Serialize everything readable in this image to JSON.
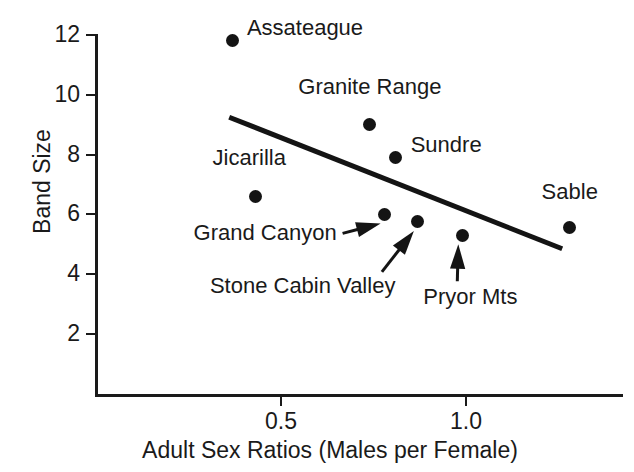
{
  "chart_data": {
    "type": "scatter",
    "title": "",
    "xlabel": "Adult Sex Ratios (Males per Female)",
    "ylabel": "Band Size",
    "xlim": [
      0.0,
      1.43
    ],
    "ylim": [
      1.0,
      12.4
    ],
    "xticks": [
      "0.5",
      "1.0"
    ],
    "xtick_values": [
      0.5,
      1.0
    ],
    "yticks": [
      "2",
      "4",
      "6",
      "8",
      "10",
      "12"
    ],
    "ytick_values": [
      2,
      4,
      6,
      8,
      10,
      12
    ],
    "grid": false,
    "legend": null,
    "points": [
      {
        "label": "Assateague",
        "x": 0.37,
        "y": 11.8,
        "label_side": "right",
        "leader": "none"
      },
      {
        "label": "Granite Range",
        "x": 0.74,
        "y": 9.0,
        "label_side": "above",
        "leader": "none"
      },
      {
        "label": "Sundre",
        "x": 0.81,
        "y": 7.9,
        "label_side": "right",
        "leader": "none"
      },
      {
        "label": "Jicarilla",
        "x": 0.43,
        "y": 6.6,
        "label_side": "above",
        "leader": "none"
      },
      {
        "label": "Grand Canyon",
        "x": 0.78,
        "y": 6.0,
        "label_side": "left",
        "leader": "arrow"
      },
      {
        "label": "Stone Cabin Valley",
        "x": 0.87,
        "y": 5.75,
        "label_side": "below",
        "leader": "arrow"
      },
      {
        "label": "Pryor Mts",
        "x": 0.99,
        "y": 5.3,
        "label_side": "below",
        "leader": "arrow"
      },
      {
        "label": "Sable",
        "x": 1.28,
        "y": 5.55,
        "label_side": "above",
        "leader": "none"
      }
    ],
    "trendline": {
      "type": "linear-fit",
      "x_start": 0.36,
      "y_start": 9.25,
      "x_end": 1.26,
      "y_end": 4.85
    },
    "colors": {
      "marker": "#141414",
      "axis": "#1a1a1a",
      "trendline": "#141414",
      "background": "#ffffff"
    }
  }
}
